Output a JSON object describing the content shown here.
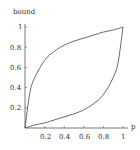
{
  "chart_data": {
    "type": "line",
    "title": "",
    "xlabel": "p",
    "ylabel": "bound",
    "xlim": [
      0,
      1
    ],
    "ylim": [
      0,
      1
    ],
    "grid": false,
    "legend": null,
    "x_ticks": [
      "0.2",
      "0.4",
      "0.6",
      "0.8",
      "1"
    ],
    "y_ticks": [
      "0.2",
      "0.4",
      "0.6",
      "0.8",
      "1"
    ],
    "series": [
      {
        "name": "upper bound",
        "x": [
          0,
          0.05,
          0.1,
          0.2,
          0.3,
          0.4,
          0.5,
          0.6,
          0.7,
          0.8,
          0.9,
          1.0
        ],
        "values": [
          0,
          0.35,
          0.5,
          0.67,
          0.76,
          0.82,
          0.86,
          0.89,
          0.92,
          0.95,
          0.97,
          1.0
        ]
      },
      {
        "name": "lower bound",
        "x": [
          0,
          0.1,
          0.2,
          0.3,
          0.4,
          0.5,
          0.6,
          0.7,
          0.8,
          0.9,
          0.95,
          1.0
        ],
        "values": [
          0,
          0.03,
          0.05,
          0.08,
          0.11,
          0.14,
          0.18,
          0.24,
          0.33,
          0.5,
          0.65,
          1.0
        ]
      }
    ]
  }
}
